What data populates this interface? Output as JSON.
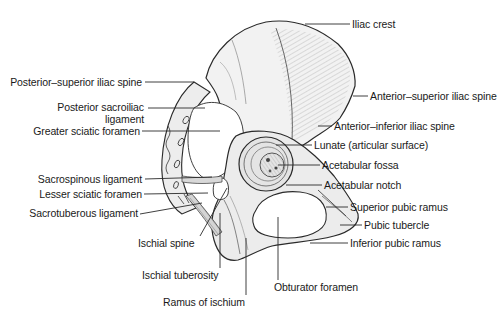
{
  "figure": {
    "colors": {
      "background": "#ffffff",
      "bone_fill": "#efefef",
      "bone_shade": "#d9d9d9",
      "outline": "#2a2a2a",
      "leader_line": "#2a2a2a",
      "text": "#1a1a1a"
    }
  },
  "labels": {
    "left": [
      {
        "id": "posterior-superior-iliac-spine",
        "text": "Posterior–superior iliac spine"
      },
      {
        "id": "posterior-sacroiliac-ligament-1",
        "text": "Posterior sacroiliac"
      },
      {
        "id": "posterior-sacroiliac-ligament-2",
        "text": "ligament"
      },
      {
        "id": "greater-sciatic-foramen",
        "text": "Greater sciatic foramen"
      },
      {
        "id": "sacrospinous-ligament",
        "text": "Sacrospinous ligament"
      },
      {
        "id": "lesser-sciatic-foramen",
        "text": "Lesser sciatic foramen"
      },
      {
        "id": "sacrotuberous-ligament",
        "text": "Sacrotuberous ligament"
      }
    ],
    "right": [
      {
        "id": "iliac-crest",
        "text": "Iliac crest"
      },
      {
        "id": "anterior-superior-iliac-spine",
        "text": "Anterior–superior iliac spine"
      },
      {
        "id": "anterior-inferior-iliac-spine",
        "text": "Anterior–inferior iliac spine"
      },
      {
        "id": "lunate",
        "text": "Lunate (articular surface)"
      },
      {
        "id": "acetabular-fossa",
        "text": "Acetabular fossa"
      },
      {
        "id": "acetabular-notch",
        "text": "Acetabular notch"
      },
      {
        "id": "superior-pubic-ramus",
        "text": "Superior pubic ramus"
      },
      {
        "id": "pubic-tubercle",
        "text": "Pubic tubercle"
      },
      {
        "id": "inferior-pubic-ramus",
        "text": "Inferior pubic ramus"
      }
    ],
    "bottom": [
      {
        "id": "ischial-spine",
        "text": "Ischial spine"
      },
      {
        "id": "ischial-tuberosity",
        "text": "Ischial tuberosity"
      },
      {
        "id": "obturator-foramen",
        "text": "Obturator foramen"
      },
      {
        "id": "ramus-of-ischium",
        "text": "Ramus of ischium"
      }
    ]
  }
}
